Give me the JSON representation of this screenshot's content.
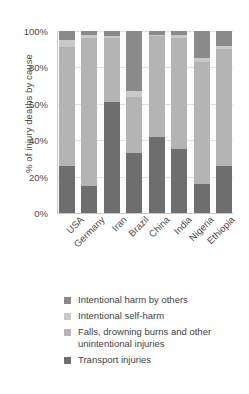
{
  "chart_data": {
    "type": "bar",
    "subtype": "stacked-bar-100-percent",
    "title": "",
    "xlabel": "",
    "ylabel": "% of injury deaths by cause",
    "ylim": [
      0,
      100
    ],
    "yticks": [
      "0%",
      "20%",
      "40%",
      "60%",
      "80%",
      "100%"
    ],
    "ytick_values": [
      0,
      20,
      40,
      60,
      80,
      100
    ],
    "grid": true,
    "legend_position": "bottom",
    "categories": [
      "USA",
      "Germany",
      "Iran",
      "Brazil",
      "China",
      "India",
      "Nigeria",
      "Ethiopia"
    ],
    "series": [
      {
        "name": "Transport injuries",
        "color": "#6e6e6e",
        "values": [
          26,
          15,
          61,
          33,
          42,
          35,
          16,
          26
        ]
      },
      {
        "name": "Falls, drowning burns and other unintentional injuries",
        "color": "#b4b4b4",
        "values": [
          65,
          81,
          35,
          31,
          55,
          61,
          67,
          64
        ]
      },
      {
        "name": "Intentional self-harm",
        "color": "#c9c9c9",
        "values": [
          4,
          2,
          1,
          3,
          1,
          2,
          2,
          2
        ]
      },
      {
        "name": "Intentional harm by others",
        "color": "#8a8a8a",
        "values": [
          5,
          2,
          3,
          33,
          2,
          2,
          15,
          8
        ]
      }
    ]
  },
  "legend": {
    "items": [
      {
        "label": "Intentional harm by others",
        "color": "#8a8a8a"
      },
      {
        "label": "Intentional self-harm",
        "color": "#c9c9c9"
      },
      {
        "label": "Falls, drowning burns and other unintentional injuries",
        "color": "#b4b4b4"
      },
      {
        "label": "Transport injuries",
        "color": "#6e6e6e"
      }
    ]
  }
}
